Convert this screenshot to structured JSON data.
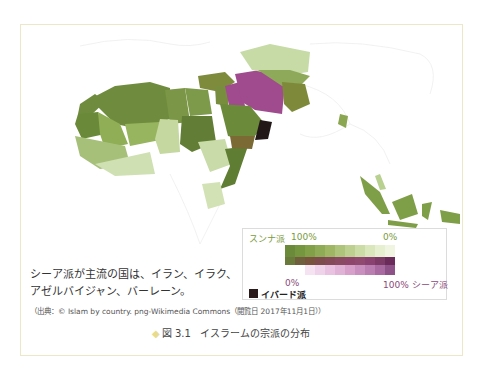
{
  "figure": {
    "number": "図 3.1",
    "title": "イスラームの宗派の分布",
    "diamond_color": "#e8dc8c"
  },
  "note": {
    "line1": "シーア派が主流の国は、イラン、イラク、",
    "line2": "アゼルバイジャン、バーレーン。"
  },
  "source": "（出典：© Islam by country. png-Wikimedia Commons（閲覧日 2017年11月1日））",
  "legend": {
    "sunni_label": "スンナ派",
    "sunni_pct": "100%",
    "zero_top": "0%",
    "zero_bottom": "0%",
    "shia_label": "100% シーア派",
    "ibadi_label": "イバード派",
    "colors": {
      "sunni_dark": "#6b8a3a",
      "sunni_light": "#e4efcc",
      "shia_dark": "#6a2a5a",
      "shia_light": "#f3dcef",
      "ibadi": "#2a1a1a"
    },
    "green_ramp": [
      "#6b8a3a",
      "#76953f",
      "#82a048",
      "#90ab55",
      "#9fb765",
      "#aec47a",
      "#bdd08f",
      "#ccdca6",
      "#dae6bc",
      "#e6efd0",
      "#f0f5e2"
    ],
    "mix_ramp": [
      "#6a7a3a",
      "#705f3c",
      "#78543f",
      "#7e4c4c",
      "#844a58",
      "#8a4a62",
      "#8e476a",
      "#904a70",
      "#8a4270",
      "#7c3a66",
      "#6a2a5a"
    ],
    "pink_ramp": [
      "#ffffff",
      "#ffffff",
      "#f6e3f2",
      "#efd3ea",
      "#e8c2e0",
      "#dfb2d6",
      "#d6a0cb",
      "#c98fbe",
      "#bb7eb0",
      "#a86aa0",
      "#8e5288"
    ]
  },
  "map": {
    "regions": [
      {
        "name": "morocco",
        "color": "#6f8c3e"
      },
      {
        "name": "algeria",
        "color": "#6f8c3e"
      },
      {
        "name": "libya",
        "color": "#7a9646"
      },
      {
        "name": "egypt",
        "color": "#7d9a4a"
      },
      {
        "name": "sudan",
        "color": "#627e36"
      },
      {
        "name": "mauritania",
        "color": "#6a8a3a"
      },
      {
        "name": "mali",
        "color": "#8fae55"
      },
      {
        "name": "niger",
        "color": "#97b45e"
      },
      {
        "name": "chad",
        "color": "#c4d8a0"
      },
      {
        "name": "ethiopia",
        "color": "#c8dba8"
      },
      {
        "name": "somalia",
        "color": "#5f7d33"
      },
      {
        "name": "tanzania",
        "color": "#d2e2b4"
      },
      {
        "name": "turkey",
        "color": "#7e8a3c"
      },
      {
        "name": "iran",
        "color": "#a04b8e"
      },
      {
        "name": "iraq",
        "color": "#a04b8e"
      },
      {
        "name": "saudi-arabia",
        "color": "#6b8a3a"
      },
      {
        "name": "yemen",
        "color": "#7b6a34"
      },
      {
        "name": "oman",
        "color": "#221818"
      },
      {
        "name": "kazakhstan",
        "color": "#c6dba6"
      },
      {
        "name": "central-asia",
        "color": "#8fa95a"
      },
      {
        "name": "afghanistan-pakistan",
        "color": "#7e8a3a"
      },
      {
        "name": "bangladesh",
        "color": "#8aa650"
      },
      {
        "name": "indonesia-malaysia",
        "color": "#7f9e48"
      }
    ]
  }
}
